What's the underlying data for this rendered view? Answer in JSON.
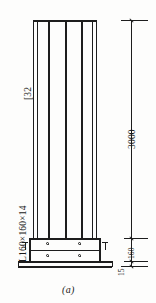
{
  "drawing": {
    "figure_caption": "(a)",
    "labels": {
      "channel": "[32",
      "angle": "L160×160×14"
    },
    "dimensions": [
      {
        "value": "3000",
        "name": "column-height"
      },
      {
        "value": "160",
        "name": "base-detail-height"
      },
      {
        "value": "15",
        "name": "base-plate-thickness"
      }
    ]
  },
  "colors": {
    "line": "#1d1d1d",
    "paper": "#fdfdfc"
  }
}
